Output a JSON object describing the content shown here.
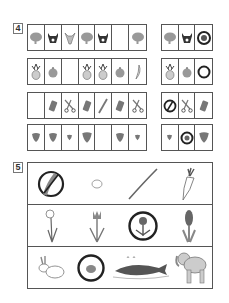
{
  "exercise4": {
    "number": "4",
    "rows": [
      {
        "sequence": [
          "elephant",
          "cow",
          "goat",
          "elephant",
          "cow",
          "",
          "elephant"
        ],
        "options": [
          "elephant",
          "cow",
          "lion-circled"
        ]
      },
      {
        "sequence": [
          "pineapple",
          "apple",
          "",
          "pineapple",
          "pineapple",
          "apple",
          "banana"
        ],
        "options": [
          "pineapple",
          "apple",
          "ring-circled"
        ]
      },
      {
        "sequence": [
          "",
          "sharpener",
          "scissors",
          "sharpener",
          "pencil",
          "sharpener",
          "scissors"
        ],
        "options": [
          "crossed-circle",
          "scissors",
          "sharpener"
        ]
      },
      {
        "sequence": [
          "strawberry-large",
          "strawberry-large",
          "strawberry-small",
          "strawberry-large",
          "",
          "strawberry-large",
          "strawberry-small"
        ],
        "options": [
          "strawberry-small",
          "circled-item",
          "strawberry-large"
        ]
      }
    ]
  },
  "exercise5": {
    "number": "5",
    "rows": [
      {
        "items": [
          "cucumber-crossed",
          "potato",
          "stick",
          "carrot"
        ]
      },
      {
        "items": [
          "daffodil",
          "tulip",
          "flower-circled",
          "hyacinth"
        ]
      },
      {
        "items": [
          "rabbit",
          "frog-circled",
          "whale",
          "elephant"
        ]
      }
    ]
  },
  "colors": {
    "border": "#555555",
    "fill_gray": "#8a8a8a",
    "fill_dark": "#333333",
    "red_apple": "#9a9a9a"
  }
}
